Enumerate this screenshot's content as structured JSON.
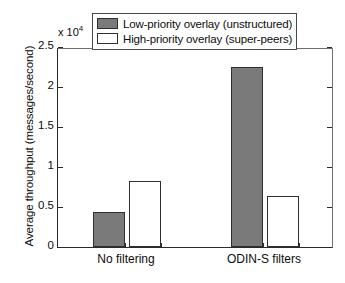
{
  "chart_data": {
    "type": "bar",
    "title": "",
    "xlabel": "",
    "ylabel": "Average throughput (messages/second)",
    "y_multiplier": "x 10",
    "y_multiplier_exp": "4",
    "categories": [
      "No filtering",
      "ODIN-S filters"
    ],
    "series": [
      {
        "name": "Low-priority overlay (unstructured)",
        "color": "#7a7a7a",
        "values": [
          4400,
          22500
        ]
      },
      {
        "name": "High-priority overlay (super-peers)",
        "color": "#ffffff",
        "values": [
          8200,
          6400
        ]
      }
    ],
    "ylim": [
      0,
      25000
    ],
    "yticks": [
      0,
      5000,
      10000,
      15000,
      20000,
      25000
    ],
    "ytick_labels": [
      "0",
      "0.5",
      "1",
      "1.5",
      "2",
      "2.5"
    ],
    "grid": false,
    "legend_position": "top-center"
  },
  "legend": {
    "entries": [
      {
        "label": "Low-priority overlay (unstructured)",
        "swatch": "low"
      },
      {
        "label": "High-priority overlay (super-peers)",
        "swatch": "high"
      }
    ]
  }
}
